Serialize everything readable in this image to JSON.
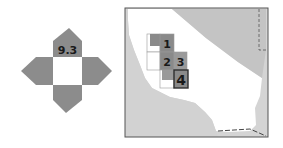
{
  "compass": {
    "label": "9.3",
    "fill_color": "#8c8c8c",
    "center_color": "#ffffff"
  },
  "locator_map": {
    "region": "California",
    "land_color": "#ffffff",
    "outside_color": "#c8c8c8",
    "grid_color": "#9a9a9a",
    "highlight_color": "#3a3a3a",
    "tiles": [
      {
        "id": "1",
        "label": "1"
      },
      {
        "id": "2",
        "label": "2"
      },
      {
        "id": "3",
        "label": "3"
      },
      {
        "id": "4",
        "label": "4",
        "highlighted": true
      }
    ]
  }
}
